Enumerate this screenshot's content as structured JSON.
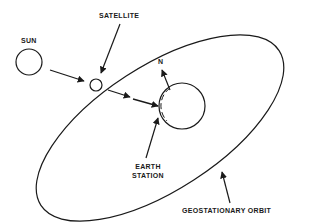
{
  "diagram": {
    "labels": {
      "sun": "SUN",
      "satellite": "SATELLITE",
      "north": "N",
      "earth_station_line1": "EARTH",
      "earth_station_line2": "STATION",
      "orbit": "GEOSTATIONARY ORBIT"
    },
    "colors": {
      "stroke": "#1a1a1a",
      "background": "#ffffff"
    },
    "elements": [
      {
        "id": "sun",
        "shape": "circle",
        "cx": 29,
        "cy": 62,
        "r": 13
      },
      {
        "id": "satellite",
        "shape": "circle",
        "cx": 96,
        "cy": 85,
        "r": 6
      },
      {
        "id": "earth",
        "shape": "circle",
        "cx": 180,
        "cy": 106,
        "r": 23
      },
      {
        "id": "geostationary-orbit",
        "shape": "ellipse"
      }
    ],
    "arrows": [
      {
        "from": "sun",
        "to": "satellite"
      },
      {
        "from": "satellite",
        "to": "earth-station"
      },
      {
        "from": "satellite-label",
        "to": "satellite"
      },
      {
        "from": "earth-station-label",
        "to": "earth-station"
      },
      {
        "from": "earth",
        "to": "north"
      },
      {
        "from": "orbit-label",
        "to": "geostationary-orbit"
      }
    ]
  }
}
